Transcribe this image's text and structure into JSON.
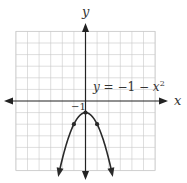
{
  "chart_data": {
    "type": "line",
    "title": "",
    "equation_label": "y = −1 − x²",
    "xlabel": "x",
    "ylabel": "y",
    "xlim": [
      -6,
      6
    ],
    "ylim": [
      -6,
      6
    ],
    "grid": true,
    "grid_step": 1,
    "legend": null,
    "annotations": [
      {
        "text": "−1",
        "x": 0,
        "y": -1,
        "position": "upper-left of vertex"
      }
    ],
    "series": [
      {
        "name": "y = -1 - x^2",
        "function": "-1 - x^2",
        "vertex": [
          0,
          -1
        ],
        "marked_points": [
          [
            -1,
            -2
          ],
          [
            0,
            -1
          ],
          [
            1,
            -2
          ]
        ],
        "x": [
          -2.3,
          -2,
          -1.5,
          -1,
          -0.5,
          0,
          0.5,
          1,
          1.5,
          2,
          2.3
        ],
        "y": [
          -6.29,
          -5,
          -3.25,
          -2,
          -1.25,
          -1,
          -1.25,
          -2,
          -3.25,
          -5,
          -6.29
        ],
        "arrows_at_ends": true
      }
    ]
  },
  "labels": {
    "x_axis": "x",
    "y_axis": "y",
    "eq_y": "y",
    "eq_rest": " = −1 − ",
    "eq_x": "x",
    "eq_exp": "2",
    "vertex_tick": "−1"
  },
  "colors": {
    "axis": "#222222",
    "grid": "#c8c8c8",
    "curve": "#2a2a2a",
    "text": "#333333"
  }
}
